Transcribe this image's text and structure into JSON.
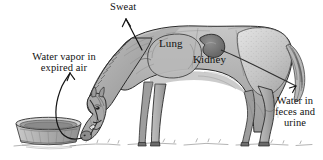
{
  "figure": {
    "background_color": "#ffffff",
    "ink_color": "#111111",
    "body_fill": "#b4b4b4",
    "shadow_fill": "#8a8a8a",
    "highlight_fill": "#d8d8d8",
    "width": 323,
    "height": 160
  },
  "labels": {
    "sweat": "Sweat",
    "water_vapor_line1": "Water vapor in",
    "water_vapor_line2": "expired air",
    "lung": "Lung",
    "kidney": "Kidney",
    "feces_line1": "Water in",
    "feces_line2": "feces and",
    "feces_line3": "urine"
  },
  "elements": {
    "animal": "horse-grazing",
    "trough": "water-trough",
    "ground": "grass-ground-line",
    "sweat_arrow": "sweat-arrow",
    "vapor_arrow": "expired-air-arrow",
    "organs": [
      "lung",
      "kidney"
    ]
  }
}
